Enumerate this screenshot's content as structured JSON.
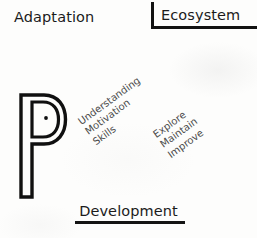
{
  "diagram": {
    "title_top_left": "Adaptation",
    "title_top_right": "Ecosystem",
    "title_bottom": "Development",
    "center_glyph": "P",
    "colors": {
      "ink": "#1b1b1b",
      "rule": "#121212",
      "annotation_text": "#4a4a4a",
      "background": "#fdfdfc"
    },
    "annotations": [
      {
        "name": "understanding-motivation-skills",
        "lines": [
          "Understanding",
          "Motivation",
          "Skills"
        ],
        "rotation_deg": -36
      },
      {
        "name": "explore-maintain-improve",
        "lines": [
          "Explore",
          "Maintain",
          "Improve"
        ],
        "rotation_deg": -36
      }
    ]
  }
}
